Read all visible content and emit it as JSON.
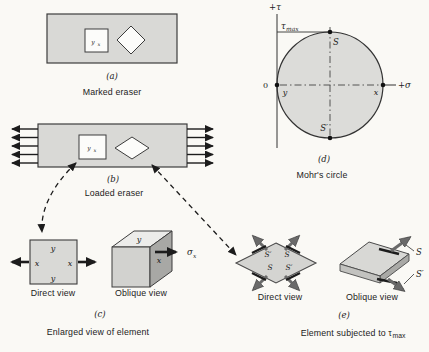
{
  "colors": {
    "background": "#faf9f5",
    "eraser_fill": "#d9d9d6",
    "circle_fill": "#dcdcd9",
    "box_top": "#ececea",
    "box_front": "#d2d2cf",
    "box_right": "#a8a8a5",
    "ink": "#1c1c1c",
    "gray_arrow": "#6a6a6a"
  },
  "panel_a": {
    "tag": "(a)",
    "caption": "Marked eraser",
    "mark_y": "y",
    "mark_x": "x"
  },
  "panel_b": {
    "tag": "(b)",
    "caption": "Loaded eraser",
    "mark_y": "y",
    "mark_x": "x"
  },
  "panel_c": {
    "tag": "(c)",
    "caption": "Enlarged view of element",
    "direct_view": "Direct view",
    "oblique_view": "Oblique view",
    "y_top": "y",
    "y_bottom": "y",
    "x_left": "x",
    "x_right": "x",
    "box_top": "y",
    "box_side": "x",
    "sigma": "σ",
    "sigma_sub": "x"
  },
  "panel_d": {
    "tag": "(d)",
    "caption": "Mohr's circle",
    "tau_axis": "+τ",
    "sigma_axis": "+σ",
    "origin": "0",
    "tau_max_base": "τ",
    "tau_max_sub": "max",
    "s_top": "S",
    "s_bottom": "S′",
    "y_point": "y",
    "x_point": "x"
  },
  "panel_e": {
    "tag": "(e)",
    "caption_base": "Element subjected to τ",
    "caption_sub": "max",
    "direct_view": "Direct view",
    "oblique_view": "Oblique view",
    "s_tl": "S′",
    "s_tr": "S",
    "s_bl": "S",
    "s_br": "S′",
    "ob_s": "S",
    "ob_sp": "S′"
  }
}
